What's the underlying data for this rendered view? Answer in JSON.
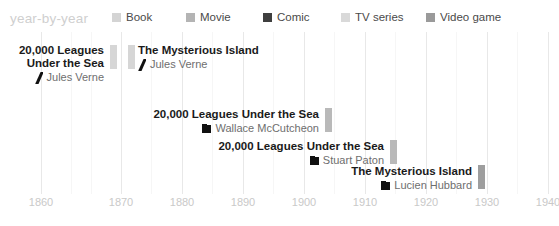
{
  "header": {
    "title": "year-by-year",
    "title_color": "#cfcfcf"
  },
  "legend": {
    "position": "top",
    "items": [
      {
        "label": "Book",
        "color": "#d4d4d4",
        "x": 112
      },
      {
        "label": "Movie",
        "color": "#b4b4b4",
        "x": 186
      },
      {
        "label": "Comic",
        "color": "#3f3f3f",
        "x": 263
      },
      {
        "label": "TV series",
        "color": "#d9d9d9",
        "x": 341
      },
      {
        "label": "Video game",
        "color": "#9a9a9a",
        "x": 426
      }
    ]
  },
  "chart_data": {
    "type": "timeline",
    "title": "year-by-year",
    "xlabel": "",
    "ylabel": "",
    "xlim": [
      1857,
      1941
    ],
    "xticks": [
      1860,
      1870,
      1880,
      1890,
      1900,
      1910,
      1920,
      1930,
      1940
    ],
    "xtick_labels": [
      "1860",
      "1870",
      "1880",
      "1890",
      "1900",
      "1910",
      "1920",
      "1930",
      "1940"
    ],
    "grid": true,
    "legend_position": "top",
    "categories": [
      "Book",
      "Movie",
      "Comic",
      "TV series",
      "Video game"
    ],
    "events": [
      {
        "title_line1": "20,000 Leagues",
        "title_line2": "Under the Sea",
        "author": "Jules Verne",
        "category": "Book",
        "glyph": "slash-icon",
        "year": 1870,
        "marker_color": "#d6d6d6",
        "marker_x": 110,
        "marker_y": 13,
        "marker_h": 24,
        "text_right": 110,
        "text_top": 12
      },
      {
        "title_line1": "The Mysterious Island",
        "title_line2": "",
        "author": "Jules Verne",
        "category": "Book",
        "glyph": "slash-icon",
        "year": 1874,
        "marker_color": "#d6d6d6",
        "marker_x": 128,
        "marker_y": 13,
        "marker_h": 24,
        "text_left": 138,
        "text_top": 12
      },
      {
        "title_line1": "20,000 Leagues Under the Sea",
        "title_line2": "",
        "author": "Wallace McCutcheon",
        "category": "Movie",
        "glyph": "square-icon",
        "year": 1905,
        "marker_color": "#b9b9b9",
        "marker_x": 325,
        "marker_y": 76,
        "marker_h": 24,
        "text_right": 325,
        "text_top": 76
      },
      {
        "title_line1": "20,000 Leagues Under the Sea",
        "title_line2": "",
        "author": "Stuart Paton",
        "category": "Movie",
        "glyph": "square-icon",
        "year": 1916,
        "marker_color": "#b9b9b9",
        "marker_x": 390,
        "marker_y": 108,
        "marker_h": 24,
        "text_right": 390,
        "text_top": 108
      },
      {
        "title_line1": "The Mysterious Island",
        "title_line2": "",
        "author": "Lucien Hubbard",
        "category": "Movie",
        "glyph": "square-icon",
        "year": 1929,
        "marker_color": "#9e9e9e",
        "marker_x": 478,
        "marker_y": 133,
        "marker_h": 24,
        "text_right": 478,
        "text_top": 133
      }
    ],
    "gridlines_major": [
      41,
      121,
      182,
      243,
      304,
      365,
      426,
      487,
      548
    ],
    "gridlines_minor": [
      71,
      91,
      151,
      212,
      273,
      334,
      395,
      456,
      517
    ]
  }
}
